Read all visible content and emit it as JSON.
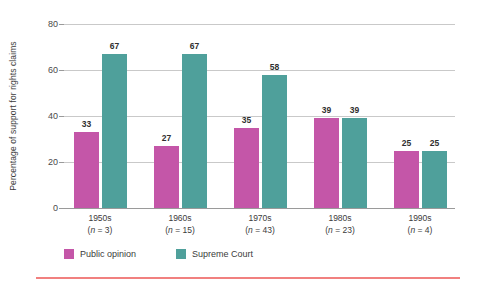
{
  "chart_data": {
    "type": "bar",
    "title": "",
    "xlabel": "",
    "ylabel": "Percentage of support for rights claims",
    "ylim": [
      0,
      80
    ],
    "yticks": [
      0,
      20,
      40,
      60,
      80
    ],
    "grid": true,
    "legend_position": "bottom-left",
    "categories": [
      "1950s",
      "1960s",
      "1970s",
      "1980s",
      "1990s"
    ],
    "category_notes": [
      "(n = 3)",
      "(n = 15)",
      "(n = 43)",
      "(n = 23)",
      "(n = 4)"
    ],
    "category_n": [
      3,
      15,
      43,
      23,
      4
    ],
    "series": [
      {
        "name": "Public opinion",
        "color": "#c456a8",
        "values": [
          33,
          27,
          35,
          39,
          25
        ]
      },
      {
        "name": "Supreme Court",
        "color": "#4fa09b",
        "values": [
          67,
          67,
          58,
          39,
          25
        ]
      }
    ]
  },
  "colors": {
    "public_opinion": "#c456a8",
    "supreme_court": "#4fa09b",
    "gridline": "#c9c9c9",
    "axis": "#9a9a9a",
    "rule": "#f1807f",
    "background": "#ffffff",
    "text": "#3b3b3b"
  }
}
